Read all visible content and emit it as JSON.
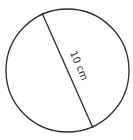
{
  "diagram": {
    "type": "circle-with-diameter",
    "shape": "circle",
    "diameter_label": "10 cm",
    "stroke_color": "#2a2a2a",
    "background_color": "#ffffff"
  }
}
